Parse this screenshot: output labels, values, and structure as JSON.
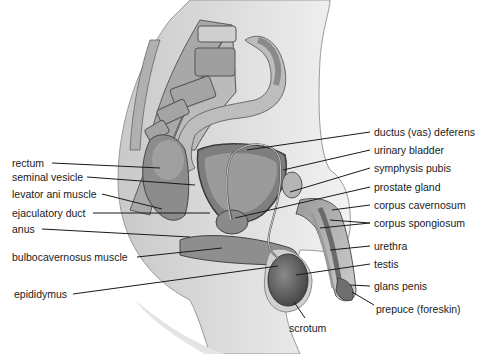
{
  "diagram": {
    "labels_left": [
      {
        "id": "rectum",
        "text": "rectum",
        "x": 12,
        "y": 157,
        "line": [
          52,
          163,
          160,
          168
        ]
      },
      {
        "id": "seminal-vesicle",
        "text": "seminal vesicle",
        "x": 12,
        "y": 171,
        "line": [
          87,
          177,
          195,
          185
        ]
      },
      {
        "id": "levator-ani-muscle",
        "text": "levator ani muscle",
        "x": 12,
        "y": 188,
        "line": [
          102,
          194,
          162,
          209
        ]
      },
      {
        "id": "ejaculatory-duct",
        "text": "ejaculatory duct",
        "x": 12,
        "y": 207,
        "line": [
          93,
          213,
          210,
          213
        ]
      },
      {
        "id": "anus",
        "text": "anus",
        "x": 12,
        "y": 223,
        "line": [
          42,
          229,
          190,
          237
        ]
      },
      {
        "id": "bulbocavernosus-muscle",
        "text": "bulbocavernosus muscle",
        "x": 12,
        "y": 251,
        "line": [
          137,
          257,
          222,
          248
        ]
      },
      {
        "id": "epididymus",
        "text": "epididymus",
        "x": 14,
        "y": 288,
        "line": [
          73,
          294,
          278,
          266
        ]
      }
    ],
    "labels_right": [
      {
        "id": "ductus-vas-deferens",
        "text": "ductus (vas) deferens",
        "x": 374,
        "y": 126,
        "line": [
          370,
          132,
          247,
          150
        ]
      },
      {
        "id": "urinary-bladder",
        "text": "urinary bladder",
        "x": 374,
        "y": 144,
        "line": [
          370,
          150,
          283,
          170
        ]
      },
      {
        "id": "symphysis-pubis",
        "text": "symphysis pubis",
        "x": 374,
        "y": 162,
        "line": [
          370,
          168,
          290,
          192
        ]
      },
      {
        "id": "prostate-gland",
        "text": "prostate gland",
        "x": 374,
        "y": 181,
        "line": [
          370,
          187,
          235,
          218
        ]
      },
      {
        "id": "corpus-cavernosum",
        "text": "corpus cavernosum",
        "x": 374,
        "y": 199,
        "line": [
          370,
          205,
          332,
          210
        ]
      },
      {
        "id": "corpus-spongiosum",
        "text": "corpus spongiosum",
        "x": 374,
        "y": 217,
        "line": [
          370,
          223,
          320,
          228
        ]
      },
      {
        "id": "urethra",
        "text": "urethra",
        "x": 374,
        "y": 240,
        "line": [
          370,
          246,
          330,
          250
        ]
      },
      {
        "id": "testis",
        "text": "testis",
        "x": 374,
        "y": 258,
        "line": [
          370,
          264,
          296,
          275
        ]
      },
      {
        "id": "glans-penis",
        "text": "glans penis",
        "x": 374,
        "y": 280,
        "line": [
          370,
          286,
          350,
          285
        ]
      },
      {
        "id": "prepuce-foreskin",
        "text": "prepuce (foreskin)",
        "x": 374,
        "y": 303,
        "line": [
          374,
          305,
          352,
          292
        ]
      }
    ],
    "labels_bottom": [
      {
        "id": "scrotum",
        "text": "scrotum",
        "x": 289,
        "y": 322,
        "line": [
          305,
          318,
          294,
          302
        ]
      }
    ]
  },
  "colors": {
    "background": "#ffffff",
    "label_text": "#1a1a1a",
    "leader_line": "#1a1a1a",
    "tissue_dark": "#6e6e6e",
    "tissue_mid": "#9a9a9a",
    "tissue_light": "#c8c8c8",
    "skin": "#d9d9d9"
  }
}
